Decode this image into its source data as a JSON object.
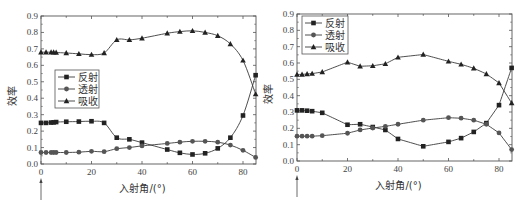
{
  "chart_data": [
    {
      "type": "line",
      "title": "",
      "xlabel": "入射角/(°)",
      "ylabel": "效率",
      "xlim": [
        0,
        86
      ],
      "ylim": [
        0,
        0.9
      ],
      "xticks": [
        0,
        20,
        40,
        60,
        80
      ],
      "yticks": [
        0.0,
        0.1,
        0.2,
        0.3,
        0.4,
        0.5,
        0.6,
        0.7,
        0.8,
        0.9
      ],
      "legend_position": "middle-left",
      "grid": false,
      "annotation": "arrow below x=0",
      "series": [
        {
          "name": "反射",
          "marker": "square",
          "x": [
            0,
            2,
            4,
            5,
            6,
            10,
            15,
            20,
            25,
            30,
            35,
            40,
            50,
            55,
            60,
            65,
            70,
            75,
            80,
            85
          ],
          "values": [
            0.25,
            0.25,
            0.252,
            0.253,
            0.255,
            0.257,
            0.258,
            0.26,
            0.25,
            0.16,
            0.15,
            0.13,
            0.088,
            0.068,
            0.058,
            0.065,
            0.095,
            0.16,
            0.295,
            0.54
          ]
        },
        {
          "name": "透射",
          "marker": "circle",
          "x": [
            0,
            2,
            4,
            5,
            6,
            10,
            15,
            20,
            25,
            30,
            35,
            40,
            50,
            55,
            60,
            65,
            70,
            75,
            80,
            85
          ],
          "values": [
            0.07,
            0.07,
            0.07,
            0.07,
            0.07,
            0.07,
            0.072,
            0.077,
            0.075,
            0.093,
            0.1,
            0.11,
            0.125,
            0.133,
            0.138,
            0.138,
            0.133,
            0.115,
            0.083,
            0.04
          ]
        },
        {
          "name": "吸收",
          "marker": "triangle",
          "x": [
            0,
            2,
            4,
            5,
            6,
            10,
            15,
            20,
            25,
            30,
            35,
            40,
            50,
            55,
            60,
            65,
            70,
            75,
            80,
            85
          ],
          "values": [
            0.68,
            0.68,
            0.68,
            0.68,
            0.678,
            0.675,
            0.67,
            0.665,
            0.675,
            0.755,
            0.755,
            0.765,
            0.795,
            0.805,
            0.81,
            0.8,
            0.78,
            0.73,
            0.63,
            0.425
          ]
        }
      ]
    },
    {
      "type": "line",
      "title": "",
      "xlabel": "入射角/(°)",
      "ylabel": "效率",
      "xlim": [
        0,
        86
      ],
      "ylim": [
        0,
        0.9
      ],
      "xticks": [
        0,
        20,
        40,
        60,
        80
      ],
      "yticks": [
        0.0,
        0.1,
        0.2,
        0.3,
        0.4,
        0.5,
        0.6,
        0.7,
        0.8,
        0.9
      ],
      "legend_position": "upper-left",
      "grid": false,
      "annotation": "arrow below x=0",
      "series": [
        {
          "name": "反射",
          "marker": "square",
          "x": [
            0,
            2,
            4,
            6,
            10,
            20,
            25,
            30,
            35,
            40,
            50,
            60,
            65,
            70,
            75,
            80,
            85
          ],
          "values": [
            0.31,
            0.31,
            0.308,
            0.305,
            0.295,
            0.222,
            0.225,
            0.208,
            0.19,
            0.135,
            0.09,
            0.117,
            0.14,
            0.178,
            0.232,
            0.342,
            0.57
          ]
        },
        {
          "name": "透射",
          "marker": "circle",
          "x": [
            0,
            2,
            4,
            6,
            10,
            20,
            25,
            30,
            35,
            40,
            50,
            60,
            65,
            70,
            75,
            80,
            85
          ],
          "values": [
            0.152,
            0.152,
            0.152,
            0.152,
            0.155,
            0.17,
            0.19,
            0.202,
            0.212,
            0.225,
            0.25,
            0.265,
            0.262,
            0.25,
            0.225,
            0.172,
            0.07
          ]
        },
        {
          "name": "吸收",
          "marker": "triangle",
          "x": [
            0,
            2,
            4,
            6,
            10,
            20,
            25,
            30,
            35,
            40,
            50,
            60,
            65,
            70,
            75,
            80,
            85
          ],
          "values": [
            0.53,
            0.53,
            0.533,
            0.535,
            0.545,
            0.605,
            0.58,
            0.583,
            0.595,
            0.635,
            0.652,
            0.61,
            0.592,
            0.568,
            0.533,
            0.478,
            0.355
          ]
        }
      ]
    }
  ],
  "panels": [
    {
      "ylabel": "效率",
      "xlabel": "入射角/(°)",
      "legend": [
        "反射",
        "透射",
        "吸收"
      ]
    },
    {
      "ylabel": "效率",
      "xlabel": "入射角/(°)",
      "legend": [
        "反射",
        "透射",
        "吸收"
      ]
    }
  ],
  "colors": {
    "line": "#3a3a3a",
    "marker": "#222222",
    "axis": "#555555"
  }
}
